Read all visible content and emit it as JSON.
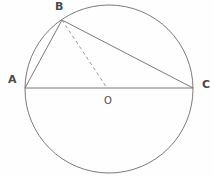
{
  "figure": {
    "background_color": "#fefefe",
    "stroke_color": "#6b6b6b",
    "label_color": "#4a4a4a",
    "width": 214,
    "height": 178
  },
  "labels": {
    "a": "A",
    "b": "B",
    "c": "C",
    "o": "O"
  },
  "chart_data": {
    "type": "diagram",
    "circle": {
      "cx": 109,
      "cy": 89,
      "r": 84,
      "stroke": "#6b6b6b",
      "stroke_width": 0.9,
      "fill": "none"
    },
    "points": [
      {
        "name": "A",
        "x": 25,
        "y": 88,
        "label_offset": [
          -17,
          -14
        ]
      },
      {
        "name": "B",
        "x": 62,
        "y": 20,
        "label_offset": [
          -7,
          -19
        ]
      },
      {
        "name": "C",
        "x": 193,
        "y": 88,
        "label_offset": [
          9,
          -9
        ]
      },
      {
        "name": "O",
        "x": 107,
        "y": 88,
        "label_offset": [
          -3,
          8
        ]
      }
    ],
    "segments": [
      {
        "name": "AC",
        "from": "A",
        "to": "C",
        "style": "solid",
        "stroke": "#6b6b6b",
        "stroke_width": 0.9
      },
      {
        "name": "AB",
        "from": "A",
        "to": "B",
        "style": "solid",
        "stroke": "#6b6b6b",
        "stroke_width": 0.9
      },
      {
        "name": "BC",
        "from": "B",
        "to": "C",
        "style": "solid",
        "stroke": "#6b6b6b",
        "stroke_width": 0.9
      },
      {
        "name": "BO",
        "from": "B",
        "to": "O",
        "style": "dashed",
        "stroke": "#8d8d8d",
        "stroke_width": 0.9,
        "dash": "3.5 2.8"
      }
    ],
    "annotations": [
      "AC is a diameter through center O",
      "B lies on the circle; angle ABC is inscribed in a semicircle",
      "BO is drawn as a dashed radius"
    ]
  }
}
